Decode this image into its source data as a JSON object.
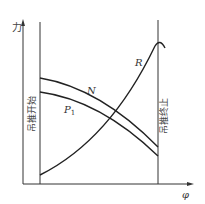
{
  "diagram": {
    "axes": {
      "y_label": "力",
      "x_label": "φ"
    },
    "markers": {
      "start_label": "吊推开始",
      "end_label": "吊推终止"
    },
    "curves": [
      {
        "name": "N",
        "label": "N",
        "description": "decreasing, upper"
      },
      {
        "name": "P1",
        "label": "P",
        "subscript": "1",
        "description": "decreasing, lower"
      },
      {
        "name": "R",
        "label": "R",
        "description": "increasing, peaks at end then curls down"
      }
    ]
  }
}
